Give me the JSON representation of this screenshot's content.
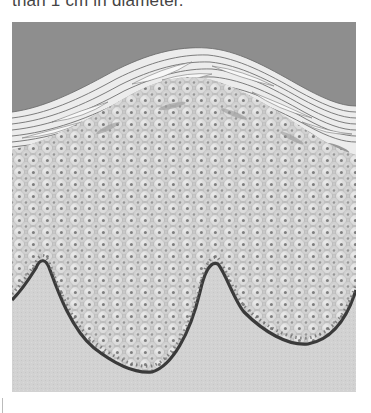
{
  "caption": {
    "text": "than 1 cm in diameter."
  },
  "figure": {
    "layers": [
      "background",
      "stratum corneum (keratin strands)",
      "stratum granulosum",
      "stratum spinosum",
      "stratum basale",
      "dermis / connective tissue"
    ],
    "colors": {
      "background": "#8e8e8e",
      "keratin": "#ececec",
      "keratin_outline": "#6f6f6f",
      "granular_streak": "#8a8a8a",
      "cell_field": "#c9c9c9",
      "cell_highlight": "#e6e6e6",
      "nucleus": "#808080",
      "basal_line": "#3a3a3a",
      "dermis": "#d2d2d2"
    }
  }
}
